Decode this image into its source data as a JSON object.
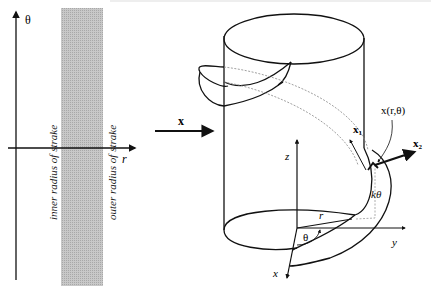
{
  "left_panel": {
    "theta_axis_label": "θ",
    "r_axis_label": "r",
    "inner_label": "inner radius of strake",
    "outer_label": "outer radius of strake",
    "band_color": "#bdbdbd"
  },
  "arrow_label": "x",
  "right_panel": {
    "z_label": "z",
    "y_label": "y",
    "x_label": "x",
    "r_label": "r",
    "theta_label": "θ",
    "ktheta_label": "kθ",
    "x1_label": "x",
    "x1_sub": "1",
    "x2_label": "x",
    "x2_sub": "2",
    "point_label": "x(r,θ)"
  }
}
